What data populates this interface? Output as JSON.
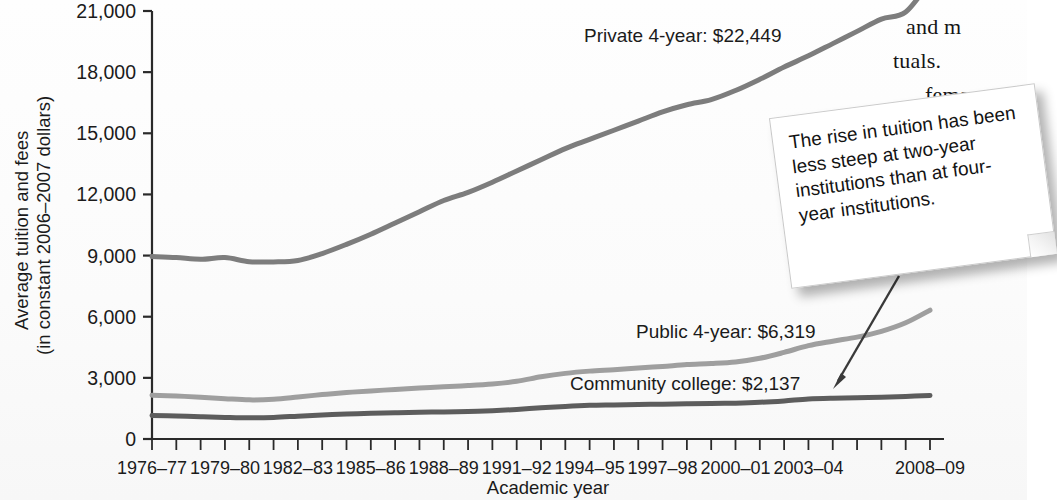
{
  "chart_data": {
    "type": "line",
    "title": "",
    "xlabel": "Academic year",
    "ylabel": "Average tuition and fees\n(in constant 2006–2007 dollars)",
    "ylabel_line1": "Average tuition and fees",
    "ylabel_line2": "(in constant 2006–2007 dollars)",
    "ylim": [
      0,
      21000
    ],
    "yticks": [
      0,
      3000,
      6000,
      9000,
      12000,
      15000,
      18000,
      21000
    ],
    "ytick_labels": [
      "0",
      "3,000",
      "6,000",
      "9,000",
      "12,000",
      "15,000",
      "18,000",
      "21,000"
    ],
    "grid": false,
    "legend_position": "inline-labels",
    "categories": [
      "1976–77",
      "1977–78",
      "1978–79",
      "1979–80",
      "1980–81",
      "1981–82",
      "1982–83",
      "1983–84",
      "1984–85",
      "1985–86",
      "1986–87",
      "1987–88",
      "1988–89",
      "1989–90",
      "1990–91",
      "1991–92",
      "1992–93",
      "1993–94",
      "1994–95",
      "1995–96",
      "1996–97",
      "1997–98",
      "1998–99",
      "1999–2000",
      "2000–01",
      "2001–02",
      "2002–03",
      "2003–04",
      "2004–05",
      "2005–06",
      "2006–07",
      "2007–08",
      "2008–09"
    ],
    "xtick_labels": [
      "1976–77",
      "1979–80",
      "1982–83",
      "1985–86",
      "1988–89",
      "1991–92",
      "1994–95",
      "1997–98",
      "2000–01",
      "2003–04",
      "2008–09"
    ],
    "xtick_indices": [
      0,
      3,
      6,
      9,
      12,
      15,
      18,
      21,
      24,
      27,
      32
    ],
    "series": [
      {
        "name": "Private 4-year",
        "label": "Private 4-year: $22,449",
        "color": "#7d7d7d",
        "end_value": 22449,
        "values": [
          8950,
          8900,
          8820,
          8900,
          8700,
          8690,
          8760,
          9100,
          9550,
          10050,
          10600,
          11150,
          11700,
          12100,
          12600,
          13150,
          13700,
          14250,
          14700,
          15150,
          15600,
          16050,
          16400,
          16650,
          17100,
          17650,
          18250,
          18800,
          19400,
          20000,
          20600,
          20950,
          22449
        ]
      },
      {
        "name": "Public 4-year",
        "label": "Public 4-year: $6,319",
        "color": "#9f9f9f",
        "end_value": 6319,
        "values": [
          2150,
          2110,
          2050,
          1980,
          1920,
          1950,
          2060,
          2180,
          2280,
          2360,
          2430,
          2500,
          2560,
          2620,
          2700,
          2830,
          3050,
          3220,
          3330,
          3400,
          3480,
          3560,
          3650,
          3700,
          3780,
          3960,
          4250,
          4580,
          4800,
          5000,
          5280,
          5700,
          6319
        ]
      },
      {
        "name": "Community college",
        "label": "Community college: $2,137",
        "color": "#5d5d5d",
        "end_value": 2137,
        "values": [
          1150,
          1130,
          1090,
          1060,
          1040,
          1060,
          1120,
          1180,
          1230,
          1260,
          1290,
          1310,
          1330,
          1350,
          1390,
          1450,
          1530,
          1600,
          1650,
          1670,
          1690,
          1710,
          1730,
          1740,
          1760,
          1800,
          1870,
          1960,
          2000,
          2020,
          2050,
          2090,
          2137
        ]
      }
    ],
    "annotation": {
      "text": "The rise in tuition has been less steep at two-year institutions than at four-year institutions.",
      "arrow_target": "Community college"
    }
  },
  "axis": {
    "x_title": "Academic year",
    "y_title_line1": "Average tuition and fees",
    "y_title_line2": "(in constant 2006–2007 dollars)"
  },
  "page_text": {
    "fragments": [
      "and m",
      "tuals.",
      "fema"
    ]
  },
  "colors": {
    "private": "#7d7d7d",
    "public": "#9f9f9f",
    "community": "#5d5d5d",
    "axis": "#2a2a2a",
    "text": "#1b1b1b",
    "callout_bg": "#ffffff"
  }
}
